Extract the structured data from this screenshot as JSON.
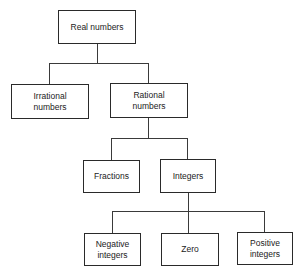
{
  "diagram": {
    "type": "tree",
    "nodes": {
      "real": {
        "label": "Real numbers"
      },
      "irrational": {
        "label": "Irrational\nnumbers"
      },
      "rational": {
        "label": "Rational\nnumbers"
      },
      "fractions": {
        "label": "Fractions"
      },
      "integers": {
        "label": "Integers"
      },
      "negative": {
        "label": "Negative\nintegers"
      },
      "zero": {
        "label": "Zero"
      },
      "positive": {
        "label": "Positive\nintegers"
      }
    },
    "edges": [
      [
        "Real numbers",
        "Irrational numbers"
      ],
      [
        "Real numbers",
        "Rational numbers"
      ],
      [
        "Rational numbers",
        "Fractions"
      ],
      [
        "Rational numbers",
        "Integers"
      ],
      [
        "Integers",
        "Negative integers"
      ],
      [
        "Integers",
        "Zero"
      ],
      [
        "Integers",
        "Positive integers"
      ]
    ]
  }
}
